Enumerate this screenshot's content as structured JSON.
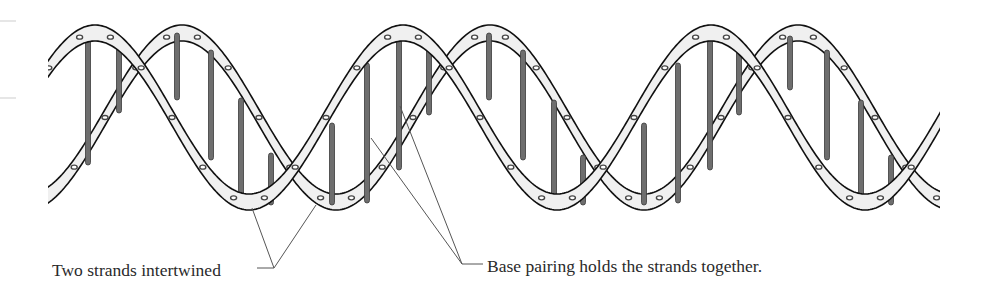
{
  "figure": {
    "colors": {
      "outline": "#111111",
      "ribbon_fill": "#f0f0f0",
      "rung_fill": "#6e6e6e",
      "rung_edge": "#3a3a3a",
      "dot": "#444444",
      "leader": "#555555",
      "text": "#2a2a2a"
    },
    "helix": {
      "x_start": 48,
      "x_end": 940,
      "period": 308,
      "top_y": 25,
      "bottom_y": 210,
      "ribbon_thickness": 16,
      "strand_a_crest_x": 95,
      "strand_b_crest_x": 182
    },
    "rungs": [
      {
        "x": 88,
        "y1": 30,
        "y2": 165
      },
      {
        "x": 119,
        "y1": 47,
        "y2": 113
      },
      {
        "x": 177,
        "y1": 33,
        "y2": 100
      },
      {
        "x": 211,
        "y1": 50,
        "y2": 160
      },
      {
        "x": 241,
        "y1": 98,
        "y2": 197
      },
      {
        "x": 271,
        "y1": 153,
        "y2": 205
      },
      {
        "x": 332,
        "y1": 123,
        "y2": 205
      },
      {
        "x": 367,
        "y1": 63,
        "y2": 203
      },
      {
        "x": 399,
        "y1": 30,
        "y2": 170
      },
      {
        "x": 429,
        "y1": 43,
        "y2": 115
      },
      {
        "x": 489,
        "y1": 33,
        "y2": 100
      },
      {
        "x": 523,
        "y1": 50,
        "y2": 160
      },
      {
        "x": 554,
        "y1": 100,
        "y2": 197
      },
      {
        "x": 583,
        "y1": 155,
        "y2": 205
      },
      {
        "x": 644,
        "y1": 123,
        "y2": 205
      },
      {
        "x": 678,
        "y1": 63,
        "y2": 203
      },
      {
        "x": 710,
        "y1": 30,
        "y2": 170
      },
      {
        "x": 739,
        "y1": 43,
        "y2": 115
      },
      {
        "x": 790,
        "y1": 36,
        "y2": 90
      },
      {
        "x": 827,
        "y1": 50,
        "y2": 160
      },
      {
        "x": 861,
        "y1": 100,
        "y2": 197
      },
      {
        "x": 891,
        "y1": 155,
        "y2": 205
      }
    ],
    "labels": [
      {
        "id": "strands",
        "text": "Two strands intertwined",
        "x": 52,
        "y": 262,
        "leader": {
          "junction": [
            274,
            268
          ],
          "tail": [
            257,
            268
          ],
          "targets": [
            [
              252,
              208
            ],
            [
              316,
              205
            ]
          ]
        }
      },
      {
        "id": "base-pairing",
        "text": "Base pairing holds the strands together.",
        "x": 487,
        "y": 258,
        "leader": {
          "junction": [
            462,
            264
          ],
          "tail": [
            483,
            264
          ],
          "targets": [
            [
              371,
              138
            ],
            [
              400,
              106
            ]
          ]
        }
      }
    ]
  }
}
